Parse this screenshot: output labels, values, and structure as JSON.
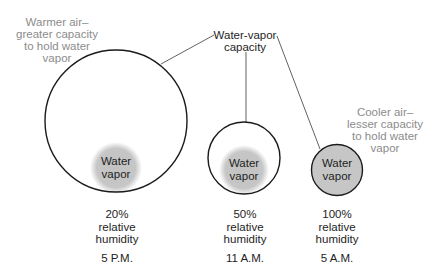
{
  "annotations": {
    "warmer": [
      "Warmer air–",
      "greater capacity",
      "to hold water",
      "vapor"
    ],
    "cooler": [
      "Cooler air–",
      "lesser capacity",
      "to hold water",
      "vapor"
    ],
    "capacity": [
      "Water-vapor",
      "capacity"
    ]
  },
  "parcels": [
    {
      "vapor_label": [
        "Water",
        "vapor"
      ],
      "percent": "20%",
      "line2": "relative",
      "line3": "humidity",
      "time": "5 P.M."
    },
    {
      "vapor_label": [
        "Water",
        "vapor"
      ],
      "percent": "50%",
      "line2": "relative",
      "line3": "humidity",
      "time": "11 A.M."
    },
    {
      "vapor_label": [
        "Water",
        "vapor"
      ],
      "percent": "100%",
      "line2": "relative",
      "line3": "humidity",
      "time": "5 A.M."
    }
  ],
  "colors": {
    "outline": "#1a1a1a",
    "vapor": "#c4c4c4",
    "annotation_text": "#8c8c8c",
    "label_text": "#1e1e1e"
  }
}
